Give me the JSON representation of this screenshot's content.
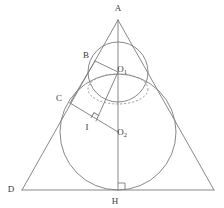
{
  "figure": {
    "kind": "geometry-diagram",
    "title": "",
    "stroke_color": "#7a7a7a",
    "dashed_stroke_color": "#8a8a8a",
    "label_color": "#3a3a3a",
    "background_color": "#ffffff",
    "stroke_width": 0.9,
    "labels": [
      {
        "id": "A",
        "text": "A",
        "sub": "",
        "x": 118,
        "y": 11
      },
      {
        "id": "B",
        "text": "B",
        "sub": "",
        "x": 86,
        "y": 58
      },
      {
        "id": "O1",
        "text": "O",
        "sub": "1",
        "x": 122,
        "y": 72
      },
      {
        "id": "C",
        "text": "C",
        "sub": "",
        "x": 59,
        "y": 101
      },
      {
        "id": "I",
        "text": "I",
        "sub": "",
        "x": 87,
        "y": 130
      },
      {
        "id": "O2",
        "text": "O",
        "sub": "2",
        "x": 122,
        "y": 135
      },
      {
        "id": "D",
        "text": "D",
        "sub": "",
        "x": 11,
        "y": 192
      },
      {
        "id": "H",
        "text": "H",
        "sub": "",
        "x": 115,
        "y": 204
      }
    ],
    "points": {
      "A": {
        "x": 118,
        "y": 20
      },
      "B": {
        "x": 95,
        "y": 61
      },
      "C": {
        "x": 70,
        "y": 103
      },
      "D": {
        "x": 22,
        "y": 190
      },
      "E": {
        "x": 214,
        "y": 190
      },
      "H": {
        "x": 118,
        "y": 190
      },
      "I": {
        "x": 96,
        "y": 121
      },
      "O1": {
        "x": 118,
        "y": 72
      },
      "O2": {
        "x": 118,
        "y": 132
      }
    },
    "circles": [
      {
        "id": "small-circle",
        "cx": 118,
        "cy": 72,
        "r": 30,
        "style": "solid"
      },
      {
        "id": "large-circle",
        "cx": 118,
        "cy": 132,
        "r": 58,
        "style": "solid"
      }
    ],
    "ellipses": [
      {
        "id": "dashed-ellipse",
        "cx": 118,
        "cy": 89,
        "rx": 30,
        "ry": 15,
        "style": "dashed"
      }
    ],
    "segments": [
      {
        "id": "side-AD",
        "from": "A",
        "to": "D"
      },
      {
        "id": "side-AE",
        "from": "A",
        "to": "E"
      },
      {
        "id": "base-DE",
        "from": "D",
        "to": "E"
      },
      {
        "id": "axis-AH",
        "from": "A",
        "to": "H"
      },
      {
        "id": "radius-O1B",
        "from": "O1",
        "to": "B"
      },
      {
        "id": "chord-CO2",
        "from": "C",
        "to": "O2"
      },
      {
        "id": "segment-O1I",
        "from": "O1",
        "to": "I"
      },
      {
        "id": "segment-BC",
        "from": "B",
        "to": "C"
      }
    ],
    "right_angles": [
      {
        "id": "right-angle-at-I",
        "x": 96,
        "y": 121,
        "size": 6,
        "rotation": -58
      },
      {
        "id": "right-angle-at-H",
        "x": 118,
        "y": 190,
        "size": 7,
        "rotation": 0
      }
    ]
  }
}
